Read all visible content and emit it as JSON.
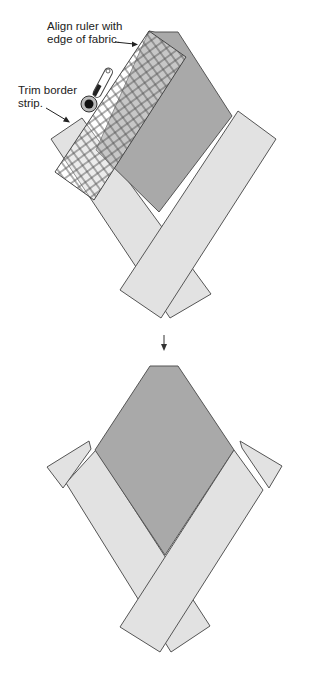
{
  "diagram": {
    "colors": {
      "background": "#ffffff",
      "diamond_fill": "#a9a9a9",
      "strip_fill": "#e2e2e2",
      "outline": "#555555",
      "ruler_grid": "#555555",
      "text": "#222222"
    },
    "step1": {
      "label_ruler_line1": "Align ruler with",
      "label_ruler_line2": "edge of fabric.",
      "label_trim_line1": "Trim border",
      "label_trim_line2": "strip.",
      "icons": [
        "rotary-cutter-icon",
        "quilting-ruler-icon"
      ]
    },
    "step_arrow": "arrow-down-icon",
    "step2": {
      "description": "Diamond block with crossed border strips and trimmed triangles removed"
    }
  }
}
